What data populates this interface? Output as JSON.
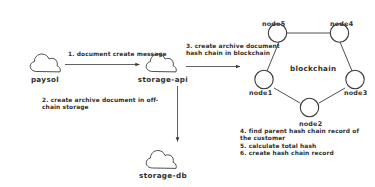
{
  "diagram": {
    "stroke_color": "#3a3a3a",
    "text_color": "#2f2f2f",
    "background": "#ffffff"
  },
  "clouds": [
    {
      "id": "paysol",
      "label": "paysol"
    },
    {
      "id": "storage-api",
      "label": "storage-api"
    },
    {
      "id": "storage-db",
      "label": "storage-db"
    }
  ],
  "flows": [
    {
      "id": "paysol-to-storage-api",
      "label": "1. document create message",
      "from": "paysol",
      "to": "storage-api",
      "direction": "right"
    },
    {
      "id": "storage-api-to-storage-db",
      "label": "2. create archive document in off-\nchain storage",
      "from": "storage-api",
      "to": "storage-db",
      "direction": "down"
    },
    {
      "id": "storage-api-to-blockchain",
      "label": "3. create archive document\nhash chain in blockchain",
      "from": "storage-api",
      "to": "blockchain",
      "direction": "right"
    }
  ],
  "blockchain": {
    "center_label": "blockchain",
    "nodes": [
      {
        "id": "node1",
        "label": "node1"
      },
      {
        "id": "node2",
        "label": "node2"
      },
      {
        "id": "node3",
        "label": "node3"
      },
      {
        "id": "node4",
        "label": "node4"
      },
      {
        "id": "node5",
        "label": "node5"
      }
    ],
    "edges": [
      [
        "node5",
        "node4"
      ],
      [
        "node4",
        "node3"
      ],
      [
        "node3",
        "node2"
      ],
      [
        "node2",
        "node1"
      ],
      [
        "node1",
        "node5"
      ]
    ]
  },
  "steps": {
    "text": "4. find parent hash chain record of\nthe customer\n5. calculate total hash\n6. create hash chain record",
    "items": [
      "4. find parent hash chain record of the customer",
      "5. calculate total hash",
      "6. create hash chain record"
    ]
  }
}
